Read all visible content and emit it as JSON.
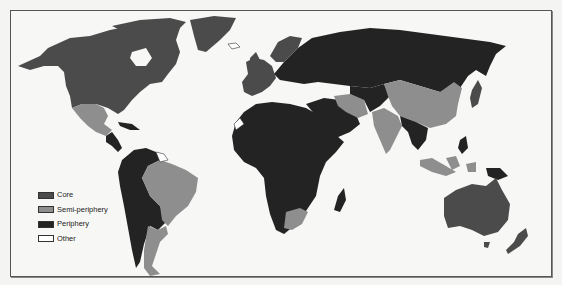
{
  "map": {
    "type": "world-systems-choropleth",
    "colors": {
      "core": "#4b4b4b",
      "semi_periphery": "#8e8e8e",
      "periphery": "#232323",
      "other": "#ffffff",
      "ocean": "#f7f7f5",
      "frame": "#555555"
    }
  },
  "legend": {
    "items": [
      {
        "label": "Core",
        "color": "#4b4b4b"
      },
      {
        "label": "Semi-periphery",
        "color": "#8e8e8e"
      },
      {
        "label": "Periphery",
        "color": "#232323"
      },
      {
        "label": "Other",
        "color": "#ffffff"
      }
    ]
  },
  "regions": {
    "core": [
      "North America (USA, Canada)",
      "Greenland",
      "Western Europe",
      "Japan",
      "Australia",
      "New Zealand"
    ],
    "semi_periphery": [
      "Mexico",
      "Brazil",
      "Argentina",
      "Chile",
      "South Africa",
      "Iran",
      "India",
      "China",
      "Indonesia",
      "Malaysia"
    ],
    "periphery": [
      "Central America",
      "Northern/Western South America",
      "Russia",
      "Eastern Europe",
      "Africa",
      "Middle East",
      "Central Asia",
      "Southeast Asia mainland",
      "Papua New Guinea"
    ],
    "other": [
      "Greenland interior",
      "Iceland",
      "Guianas",
      "Western Sahara"
    ]
  }
}
